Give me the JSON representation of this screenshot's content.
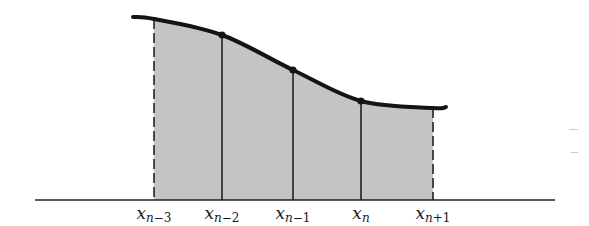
{
  "diagram": {
    "title": "",
    "colors": {
      "fill": "#c4c4c4",
      "curve": "#141414",
      "lines": "#222222",
      "axis": "#222222",
      "background": "#ffffff"
    },
    "axis": {
      "x1": 35,
      "x2": 555,
      "y": 200
    },
    "curve": {
      "start": {
        "x": 133,
        "y": 17
      },
      "end": {
        "x": 446,
        "y": 107
      }
    },
    "nodes": [
      {
        "id": "x_n-3",
        "var": "x",
        "sub_main": "n",
        "sub_rest": "−3",
        "x": 154,
        "y_curve": 19,
        "style": "dashed",
        "dot": false
      },
      {
        "id": "x_n-2",
        "var": "x",
        "sub_main": "n",
        "sub_rest": "−2",
        "x": 222,
        "y_curve": 35,
        "style": "solid",
        "dot": true
      },
      {
        "id": "x_n-1",
        "var": "x",
        "sub_main": "n",
        "sub_rest": "−1",
        "x": 293,
        "y_curve": 70,
        "style": "solid",
        "dot": true
      },
      {
        "id": "x_n",
        "var": "x",
        "sub_main": "n",
        "sub_rest": "",
        "x": 361,
        "y_curve": 101,
        "style": "solid",
        "dot": true
      },
      {
        "id": "x_n+1",
        "var": "x",
        "sub_main": "n",
        "sub_rest": "+1",
        "x": 433,
        "y_curve": 108,
        "style": "dashed",
        "dot": false
      }
    ],
    "labels_y": 203,
    "stray_marks": [
      {
        "x": 569,
        "y": 129,
        "w": 9
      },
      {
        "x": 571,
        "y": 152,
        "w": 7
      }
    ]
  }
}
